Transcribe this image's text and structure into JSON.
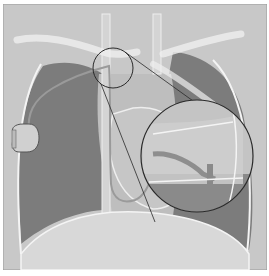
{
  "figure": {
    "colors": {
      "background": "#c9c9c9",
      "lung": "#7a7a7a",
      "soft_tissue": "#bdbdbd",
      "diaphragm": "#d6d6d6",
      "bone_outline": "#f2f2f2",
      "inset_outline": "#2a2a2a",
      "device": "#cfcfcf",
      "frame": "#9a9a9a"
    }
  }
}
